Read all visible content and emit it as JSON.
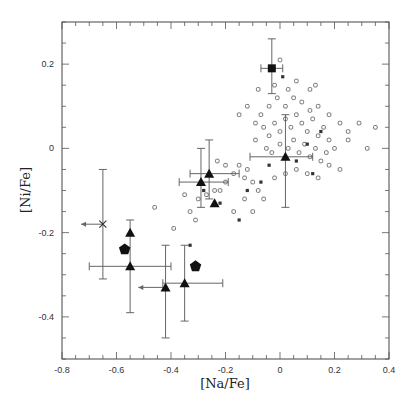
{
  "chart_data": {
    "type": "scatter",
    "title": "",
    "xlabel": "[Na/Fe]",
    "ylabel": "[Ni/Fe]",
    "xlim": [
      -0.8,
      0.4
    ],
    "ylim": [
      -0.5,
      0.3
    ],
    "grid": false,
    "legend": null,
    "x_ticks": [
      -0.8,
      -0.6,
      -0.4,
      -0.2,
      0,
      0.2,
      0.4
    ],
    "x_tick_labels": [
      "-0.8",
      "-0.6",
      "-0.4",
      "-0.2",
      "0",
      "0.2",
      "0.4"
    ],
    "y_ticks": [
      -0.4,
      -0.2,
      0,
      0.2
    ],
    "y_tick_labels": [
      "-0.4",
      "-0.2",
      "0",
      "0.2"
    ],
    "series": [
      {
        "name": "triangles (with error bars)",
        "marker": "filled-triangle",
        "points": [
          {
            "x": -0.55,
            "y": -0.2,
            "yerr": [
              -0.39,
              -0.17
            ]
          },
          {
            "x": -0.55,
            "y": -0.28,
            "xerr": [
              -0.7,
              -0.4
            ]
          },
          {
            "x": -0.42,
            "y": -0.33,
            "xerr_left_arrow": -0.52,
            "yerr": [
              -0.45,
              -0.23
            ]
          },
          {
            "x": -0.35,
            "y": -0.32,
            "xerr": [
              -0.43,
              -0.21
            ],
            "yerr": [
              -0.41,
              -0.23
            ]
          },
          {
            "x": -0.29,
            "y": -0.08,
            "xerr": [
              -0.37,
              -0.19
            ],
            "yerr": [
              -0.14,
              0.0
            ]
          },
          {
            "x": -0.26,
            "y": -0.06,
            "xerr": [
              -0.33,
              -0.15
            ],
            "yerr": [
              -0.12,
              0.02
            ]
          },
          {
            "x": -0.24,
            "y": -0.13
          },
          {
            "x": 0.02,
            "y": -0.02,
            "xerr": [
              -0.11,
              0.12
            ],
            "yerr": [
              -0.14,
              0.08
            ]
          }
        ]
      },
      {
        "name": "pentagons",
        "marker": "filled-pentagon",
        "points": [
          {
            "x": -0.57,
            "y": -0.24
          },
          {
            "x": -0.31,
            "y": -0.28
          }
        ]
      },
      {
        "name": "filled square",
        "marker": "filled-square",
        "points": [
          {
            "x": -0.03,
            "y": 0.19,
            "xerr": [
              -0.07,
              0.01
            ],
            "yerr": [
              0.13,
              0.26
            ]
          }
        ]
      },
      {
        "name": "cross (upper limit)",
        "marker": "x-cross",
        "points": [
          {
            "x": -0.65,
            "y": -0.18,
            "xerr_left_arrow": -0.73,
            "yerr": [
              -0.31,
              -0.05
            ]
          }
        ]
      },
      {
        "name": "comparison sample (open circles/squares)",
        "marker": "open-square",
        "points": [
          {
            "x": -0.46,
            "y": -0.14
          },
          {
            "x": -0.39,
            "y": -0.19
          },
          {
            "x": -0.33,
            "y": -0.15
          },
          {
            "x": -0.31,
            "y": -0.17
          },
          {
            "x": -0.35,
            "y": -0.11
          },
          {
            "x": -0.3,
            "y": -0.12
          },
          {
            "x": -0.27,
            "y": -0.11
          },
          {
            "x": -0.24,
            "y": -0.1
          },
          {
            "x": -0.22,
            "y": -0.1
          },
          {
            "x": -0.2,
            "y": -0.08
          },
          {
            "x": -0.23,
            "y": -0.03
          },
          {
            "x": -0.2,
            "y": -0.04
          },
          {
            "x": -0.17,
            "y": -0.06
          },
          {
            "x": -0.15,
            "y": -0.04
          },
          {
            "x": -0.13,
            "y": -0.07
          },
          {
            "x": -0.12,
            "y": -0.05
          },
          {
            "x": -0.1,
            "y": -0.08
          },
          {
            "x": -0.08,
            "y": -0.1
          },
          {
            "x": -0.06,
            "y": -0.12
          },
          {
            "x": -0.13,
            "y": -0.12
          },
          {
            "x": -0.1,
            "y": -0.15
          },
          {
            "x": -0.17,
            "y": -0.15
          },
          {
            "x": -0.09,
            "y": 0.02
          },
          {
            "x": -0.06,
            "y": 0.05
          },
          {
            "x": -0.04,
            "y": 0.03
          },
          {
            "x": -0.02,
            "y": 0.06
          },
          {
            "x": 0.0,
            "y": 0.04
          },
          {
            "x": 0.02,
            "y": 0.07
          },
          {
            "x": 0.04,
            "y": 0.05
          },
          {
            "x": 0.06,
            "y": 0.08
          },
          {
            "x": 0.08,
            "y": 0.06
          },
          {
            "x": 0.1,
            "y": 0.04
          },
          {
            "x": 0.12,
            "y": 0.07
          },
          {
            "x": 0.14,
            "y": 0.03
          },
          {
            "x": 0.16,
            "y": 0.05
          },
          {
            "x": 0.18,
            "y": 0.02
          },
          {
            "x": -0.05,
            "y": 0.0
          },
          {
            "x": -0.03,
            "y": -0.01
          },
          {
            "x": 0.0,
            "y": 0.01
          },
          {
            "x": 0.03,
            "y": 0.0
          },
          {
            "x": 0.05,
            "y": 0.02
          },
          {
            "x": 0.07,
            "y": -0.01
          },
          {
            "x": 0.09,
            "y": 0.01
          },
          {
            "x": 0.11,
            "y": -0.02
          },
          {
            "x": 0.13,
            "y": 0.0
          },
          {
            "x": 0.15,
            "y": -0.03
          },
          {
            "x": 0.17,
            "y": -0.01
          },
          {
            "x": 0.2,
            "y": 0.0
          },
          {
            "x": -0.07,
            "y": 0.08
          },
          {
            "x": -0.04,
            "y": 0.1
          },
          {
            "x": -0.01,
            "y": 0.12
          },
          {
            "x": 0.02,
            "y": 0.1
          },
          {
            "x": 0.05,
            "y": 0.12
          },
          {
            "x": 0.08,
            "y": 0.11
          },
          {
            "x": 0.11,
            "y": 0.09
          },
          {
            "x": 0.14,
            "y": 0.1
          },
          {
            "x": 0.18,
            "y": 0.08
          },
          {
            "x": 0.22,
            "y": 0.06
          },
          {
            "x": 0.25,
            "y": 0.04
          },
          {
            "x": 0.29,
            "y": 0.06
          },
          {
            "x": 0.35,
            "y": 0.05
          },
          {
            "x": -0.08,
            "y": 0.14
          },
          {
            "x": -0.02,
            "y": 0.15
          },
          {
            "x": 0.03,
            "y": 0.14
          },
          {
            "x": 0.06,
            "y": 0.16
          },
          {
            "x": 0.11,
            "y": 0.14
          },
          {
            "x": 0.0,
            "y": 0.21
          },
          {
            "x": 0.13,
            "y": 0.15
          },
          {
            "x": -0.12,
            "y": 0.1
          },
          {
            "x": -0.15,
            "y": 0.08
          },
          {
            "x": -0.09,
            "y": 0.06
          },
          {
            "x": 0.06,
            "y": -0.05
          },
          {
            "x": 0.1,
            "y": -0.06
          },
          {
            "x": 0.14,
            "y": -0.07
          },
          {
            "x": 0.22,
            "y": -0.05
          },
          {
            "x": 0.02,
            "y": -0.06
          },
          {
            "x": -0.02,
            "y": -0.07
          },
          {
            "x": 0.18,
            "y": -0.04
          },
          {
            "x": 0.25,
            "y": 0.02
          },
          {
            "x": 0.32,
            "y": 0.0
          }
        ]
      },
      {
        "name": "small filled dots",
        "marker": "small-dot",
        "points": [
          {
            "x": -0.33,
            "y": -0.23
          },
          {
            "x": -0.28,
            "y": -0.1
          },
          {
            "x": -0.22,
            "y": -0.13
          },
          {
            "x": -0.12,
            "y": -0.1
          },
          {
            "x": -0.07,
            "y": -0.08
          },
          {
            "x": 0.06,
            "y": -0.03
          },
          {
            "x": 0.12,
            "y": -0.06
          },
          {
            "x": 0.01,
            "y": 0.17
          },
          {
            "x": 0.1,
            "y": 0.01
          },
          {
            "x": 0.15,
            "y": 0.04
          },
          {
            "x": -0.04,
            "y": -0.04
          },
          {
            "x": -0.15,
            "y": -0.17
          }
        ]
      }
    ]
  }
}
